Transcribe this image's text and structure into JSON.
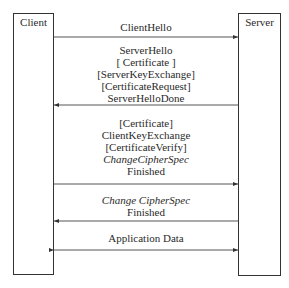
{
  "diagram": {
    "type": "sequence",
    "participants": [
      {
        "id": "client",
        "label": "Client"
      },
      {
        "id": "server",
        "label": "Server"
      }
    ],
    "messages": [
      {
        "from": "client",
        "to": "server",
        "bidirectional": false,
        "lines": [
          {
            "text": "ClientHello",
            "italic": false
          }
        ]
      },
      {
        "from": "server",
        "to": "client",
        "bidirectional": false,
        "lines": [
          {
            "text": "ServerHello",
            "italic": false
          },
          {
            "text": "[ Certificate ]",
            "italic": false
          },
          {
            "text": "[ServerKeyExchange]",
            "italic": false
          },
          {
            "text": "[CertificateRequest]",
            "italic": false
          },
          {
            "text": "ServerHelloDone",
            "italic": false
          }
        ]
      },
      {
        "from": "client",
        "to": "server",
        "bidirectional": false,
        "lines": [
          {
            "text": "[Certificate]",
            "italic": false
          },
          {
            "text": "ClientKeyExchange",
            "italic": false
          },
          {
            "text": "[CertificateVerify]",
            "italic": false
          },
          {
            "text": "ChangeCipherSpec",
            "italic": true
          },
          {
            "text": "Finished",
            "italic": false
          }
        ]
      },
      {
        "from": "server",
        "to": "client",
        "bidirectional": false,
        "lines": [
          {
            "text": "Change CipherSpec",
            "italic": true
          },
          {
            "text": "Finished",
            "italic": false
          }
        ]
      },
      {
        "from": "client",
        "to": "server",
        "bidirectional": true,
        "lines": [
          {
            "text": "Application Data",
            "italic": false
          }
        ]
      }
    ]
  },
  "colors": {
    "line": "#444444",
    "text": "#2a2a2a",
    "background": "#ffffff"
  }
}
